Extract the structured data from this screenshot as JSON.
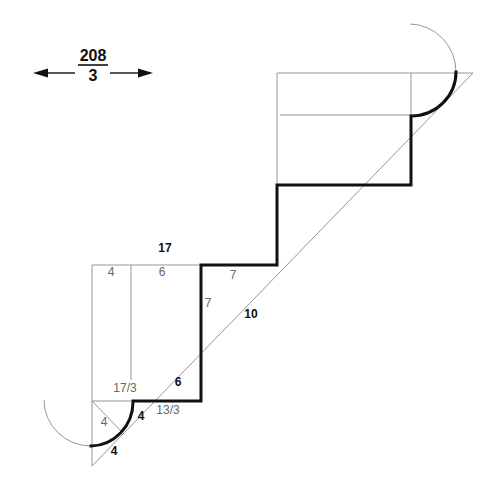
{
  "figure": {
    "width_annotation": {
      "numerator": "208",
      "denominator": "3"
    },
    "labels": {
      "total_top": "17",
      "left_segment_4": "4",
      "left_segment_6": "6",
      "left_inner_17_3": "17/3",
      "bottom_13_3": "13/3",
      "step_7_horizontal": "7",
      "step_7_vertical": "7",
      "diagonal_10": "10",
      "diagonal_6": "6",
      "arc_inner_4": "4",
      "arc_right_4": "4",
      "arc_bottom_4": "4"
    },
    "colors": {
      "thick_line": "#111111",
      "thin_line": "#8a8a8a",
      "label_regular": "#666666",
      "label_bold": "#111111"
    }
  }
}
